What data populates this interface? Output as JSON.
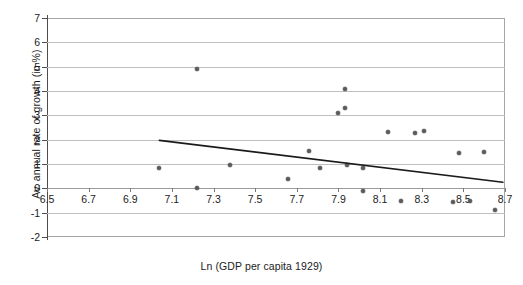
{
  "chart_data": {
    "type": "scatter",
    "title": "",
    "xlabel": "Ln (GDP per capita 1929)",
    "ylabel": "Av. annual rate of growth (in %)",
    "xlim": [
      6.5,
      8.7
    ],
    "ylim": [
      -2,
      7
    ],
    "xticks": [
      "6.5",
      "6.7",
      "6.9",
      "7.1",
      "7.3",
      "7.5",
      "7.7",
      "7.9",
      "8.1",
      "8.3",
      "8.5",
      "8.7"
    ],
    "xtick_values": [
      6.5,
      6.7,
      6.9,
      7.1,
      7.3,
      7.5,
      7.7,
      7.9,
      8.1,
      8.3,
      8.5,
      8.7
    ],
    "yticks": [
      "7",
      "6",
      "5",
      "4",
      "3",
      "2",
      "1",
      "0",
      "-1",
      "-2"
    ],
    "ytick_values": [
      7,
      6,
      5,
      4,
      3,
      2,
      1,
      0,
      -1,
      -2
    ],
    "grid": true,
    "legend": false,
    "point_color": "#5a5a5a",
    "trendline_color": "#1a1a1a",
    "grid_color": "#bfbfbf",
    "axis_color": "#4d4d4d",
    "points": [
      {
        "x": 7.04,
        "y": 0.85
      },
      {
        "x": 7.22,
        "y": 4.91
      },
      {
        "x": 7.22,
        "y": 0.0
      },
      {
        "x": 7.38,
        "y": 0.95
      },
      {
        "x": 7.66,
        "y": 0.4
      },
      {
        "x": 7.76,
        "y": 1.52
      },
      {
        "x": 7.81,
        "y": 0.82
      },
      {
        "x": 7.9,
        "y": 3.1
      },
      {
        "x": 7.93,
        "y": 3.3
      },
      {
        "x": 7.93,
        "y": 4.1
      },
      {
        "x": 7.94,
        "y": 0.95
      },
      {
        "x": 8.02,
        "y": 0.82
      },
      {
        "x": 8.02,
        "y": -0.1
      },
      {
        "x": 8.14,
        "y": 2.3
      },
      {
        "x": 8.2,
        "y": -0.5
      },
      {
        "x": 8.27,
        "y": 2.26
      },
      {
        "x": 8.31,
        "y": 2.36
      },
      {
        "x": 8.45,
        "y": -0.55
      },
      {
        "x": 8.48,
        "y": 1.45
      },
      {
        "x": 8.53,
        "y": -0.52
      },
      {
        "x": 8.6,
        "y": 1.48
      },
      {
        "x": 8.65,
        "y": -0.9
      }
    ],
    "trendline": {
      "x0": 7.04,
      "y0": 1.97,
      "x1": 8.69,
      "y1": 0.25
    }
  }
}
